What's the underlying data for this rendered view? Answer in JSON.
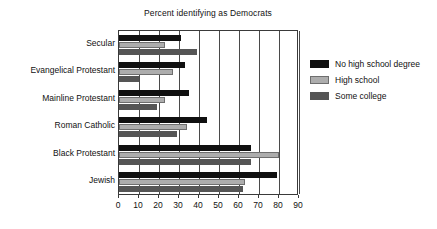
{
  "chart_data": {
    "type": "bar",
    "orientation": "horizontal",
    "title": "Percent identifying as Democrats",
    "xlabel": "",
    "ylabel": "",
    "xlim": [
      0,
      90
    ],
    "xticks": [
      0,
      10,
      20,
      30,
      40,
      50,
      60,
      70,
      80,
      90
    ],
    "grid": true,
    "grid_axis": "x",
    "legend_position": "right",
    "categories": [
      "Secular",
      "Evangelical Protestant",
      "Mainline Protestant",
      "Roman Catholic",
      "Black Protestant",
      "Jewish"
    ],
    "series": [
      {
        "name": "No high school degree",
        "color": "#101010",
        "values": [
          31,
          33,
          35,
          44,
          66,
          79
        ]
      },
      {
        "name": "High school",
        "color": "#adadad",
        "values": [
          23,
          27,
          23,
          34,
          80,
          63
        ]
      },
      {
        "name": "Some college",
        "color": "#555555",
        "values": [
          39,
          10,
          19,
          29,
          66,
          62
        ]
      }
    ]
  },
  "legend": {
    "items": [
      {
        "label": "No high school degree",
        "swatch": "#101010"
      },
      {
        "label": "High school",
        "swatch": "#adadad"
      },
      {
        "label": "Some college",
        "swatch": "#555555"
      }
    ]
  },
  "colors": {
    "background": "#ffffff",
    "axis": "#3a3a3a",
    "text": "#111111",
    "series_no_high_school": "#101010",
    "series_high_school": "#adadad",
    "series_some_college": "#555555"
  }
}
